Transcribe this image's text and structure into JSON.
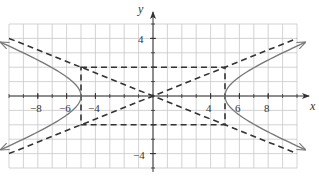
{
  "chart_data": {
    "type": "line",
    "title": "",
    "xlabel": "x",
    "ylabel": "y",
    "xlim": [
      -10,
      10
    ],
    "ylim": [
      -5,
      5
    ],
    "grid": true,
    "x_tick_labels": [
      "-8",
      "-6",
      "-4",
      "4",
      "6",
      "8"
    ],
    "x_ticks": [
      -8,
      -6,
      -4,
      4,
      6,
      8
    ],
    "y_tick_labels": [
      "4",
      "-4"
    ],
    "y_ticks": [
      4,
      -4
    ],
    "equation": "x^2/25 - y^2/4 = 1",
    "series": [
      {
        "name": "hyperbola-right-branch",
        "style": "solid",
        "color": "#777777",
        "vertex": [
          5,
          0
        ],
        "x_range": [
          5,
          9.5
        ]
      },
      {
        "name": "hyperbola-left-branch",
        "style": "solid",
        "color": "#777777",
        "vertex": [
          -5,
          0
        ],
        "x_range": [
          -9.5,
          -5
        ]
      },
      {
        "name": "asymptote-positive",
        "style": "dashed",
        "color": "#333333",
        "points": [
          [
            -10,
            -4
          ],
          [
            10,
            4
          ]
        ]
      },
      {
        "name": "asymptote-negative",
        "style": "dashed",
        "color": "#333333",
        "points": [
          [
            -10,
            4
          ],
          [
            10,
            -4
          ]
        ]
      },
      {
        "name": "fundamental-rectangle",
        "style": "dashed",
        "color": "#333333",
        "corners": [
          [
            -5,
            2
          ],
          [
            5,
            2
          ],
          [
            5,
            -2
          ],
          [
            -5,
            -2
          ]
        ]
      }
    ]
  },
  "labels": {
    "x_axis": "x",
    "y_axis": "y",
    "ticks": {
      "xm8": "−8",
      "xm6": "−6",
      "xm4": "−4",
      "x4": "4",
      "x6": "6",
      "x8": "8",
      "y4": "4",
      "ym4": "−4"
    }
  },
  "colors": {
    "grid": "#c8c8c8",
    "axis": "#333333",
    "curve": "#777777",
    "dashed": "#333333"
  }
}
